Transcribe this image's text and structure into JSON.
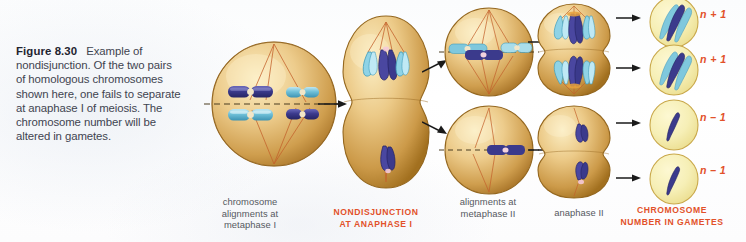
{
  "figure": {
    "number": "Figure 8.30",
    "caption": "Example of nondisjunction. Of the two pairs of homologous chromosomes shown here, one fails to separate at anaphase I of meiosis. The chromosome number will be altered in gametes."
  },
  "stage_labels": {
    "metaphase_i": "chromosome\nalignments at\nmetaphase I",
    "metaphase_i_line1": "chromosome",
    "metaphase_i_line2": "alignments at",
    "metaphase_i_line3": "metaphase I",
    "nondisjunction_line1": "NONDISJUNCTION",
    "nondisjunction_line2": "AT ANAPHASE I",
    "metaphase_ii_line1": "alignments at",
    "metaphase_ii_line2": "metaphase II",
    "anaphase_ii": "anaphase II",
    "gametes_line1": "CHROMOSOME",
    "gametes_line2": "NUMBER IN GAMETES"
  },
  "ploidy_labels": [
    "n + 1",
    "n + 1",
    "n – 1",
    "n – 1"
  ],
  "colors": {
    "accent": "#e2512a",
    "caption_text": "#3f4450",
    "label_text": "#55595f",
    "cell_fill_light": "#f0d79a",
    "cell_fill_mid": "#d9ab5c",
    "cell_fill_dark": "#b07f32",
    "gamete_fill": "#f5eeb4",
    "gamete_outline": "#c9a84a",
    "chromosome_dark": "#3b3a8c",
    "chromosome_light": "#7fc8dd",
    "spindle": "#c4622c",
    "plate_line": "#5a4a2a"
  },
  "diagram": {
    "type": "meiosis-nondisjunction-flow",
    "columns": [
      {
        "name": "metaphase-i",
        "cells": 1,
        "chromosome_pairs": 4
      },
      {
        "name": "anaphase-i-nondisjunction",
        "cells": 1,
        "chromosomes_top_pole": 3,
        "chromosomes_bottom_pole": 1
      },
      {
        "name": "metaphase-ii",
        "cells": 2,
        "chromosomes": [
          3,
          1
        ]
      },
      {
        "name": "anaphase-ii",
        "cells": 2,
        "chromosomes_per_pole": [
          3,
          1
        ]
      },
      {
        "name": "gametes",
        "cells": 4,
        "chromosomes": [
          3,
          3,
          1,
          1
        ]
      }
    ]
  }
}
